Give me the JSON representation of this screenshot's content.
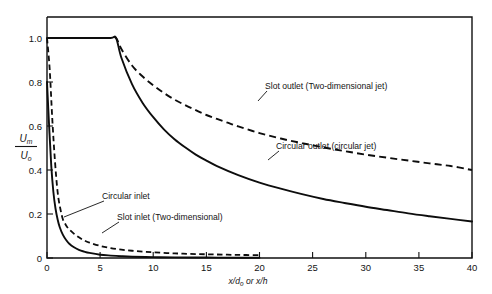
{
  "chart_data": {
    "type": "line",
    "title": "",
    "subtitle": "",
    "xlabel": "x/d₀ or x/h",
    "xlabel_parts": {
      "num": "x",
      "den": "d",
      "den_sub": "o",
      "conj": " or ",
      "second": "x/h"
    },
    "ylabel": "Um/Uo",
    "ylabel_parts": {
      "numerator": "U",
      "numerator_sub": "m",
      "denominator": "U",
      "denominator_sub": "o"
    },
    "xlim": [
      0,
      40
    ],
    "ylim": [
      0,
      1.0
    ],
    "xticks": [
      0,
      5,
      10,
      15,
      20,
      25,
      30,
      35,
      40
    ],
    "xticklabels": [
      "0",
      "5",
      "10",
      "15",
      "20",
      "25",
      "30",
      "35",
      "40"
    ],
    "yticks": [
      0,
      0.2,
      0.4,
      0.6,
      0.8,
      1.0
    ],
    "yticklabels": [
      "0",
      "0.2",
      "0.4",
      "0.6",
      "0.8",
      "1.0"
    ],
    "grid": false,
    "legend": "none",
    "series": [
      {
        "name": "Slot outlet (Two-dimensional jet)",
        "style": "dashed",
        "x": [
          0,
          2,
          4,
          6,
          6.5,
          7,
          8,
          9,
          10,
          11,
          12,
          13,
          14,
          15,
          16,
          17,
          18,
          20,
          22,
          24,
          26,
          28,
          30,
          32,
          34,
          36,
          38,
          40
        ],
        "y": [
          1.0,
          1.0,
          1.0,
          1.0,
          1.0,
          0.95,
          0.875,
          0.825,
          0.785,
          0.75,
          0.72,
          0.695,
          0.672,
          0.65,
          0.632,
          0.615,
          0.598,
          0.568,
          0.543,
          0.522,
          0.503,
          0.486,
          0.47,
          0.456,
          0.443,
          0.43,
          0.418,
          0.4
        ]
      },
      {
        "name": "Circular outlet (circular jet)",
        "style": "solid",
        "x": [
          0,
          2,
          4,
          6,
          6.5,
          7,
          8,
          9,
          10,
          11,
          12,
          13,
          14,
          15,
          16,
          18,
          20,
          22,
          24,
          26,
          28,
          30,
          32,
          34,
          36,
          38,
          40
        ],
        "y": [
          1.0,
          1.0,
          1.0,
          1.0,
          1.0,
          0.91,
          0.79,
          0.705,
          0.64,
          0.585,
          0.54,
          0.503,
          0.47,
          0.443,
          0.418,
          0.377,
          0.343,
          0.315,
          0.29,
          0.268,
          0.25,
          0.233,
          0.218,
          0.203,
          0.19,
          0.178,
          0.166
        ]
      },
      {
        "name": "Circular inlet",
        "style": "dashed-fine",
        "x": [
          0,
          0.25,
          0.5,
          0.75,
          1.0,
          1.25,
          1.5,
          1.75,
          2.0,
          2.5,
          3.0,
          3.5,
          4.0,
          5.0,
          6.0,
          7.0,
          8.0,
          9.0,
          10.0,
          12.0,
          14.0,
          16.0,
          18.0,
          20.0
        ],
        "y": [
          1.0,
          0.86,
          0.63,
          0.44,
          0.3,
          0.225,
          0.175,
          0.152,
          0.135,
          0.112,
          0.094,
          0.08,
          0.07,
          0.055,
          0.045,
          0.038,
          0.033,
          0.029,
          0.026,
          0.021,
          0.018,
          0.016,
          0.014,
          0.013
        ]
      },
      {
        "name": "Slot inlet (Two-dimensional)",
        "style": "solid",
        "x": [
          0,
          0.2,
          0.4,
          0.6,
          0.8,
          1.0,
          1.2,
          1.5,
          1.8,
          2.1,
          2.5,
          3.0,
          3.5,
          4.0,
          5.0,
          6.0,
          7.0,
          8.0,
          10.0,
          12.0,
          15.0,
          18.0,
          20.0
        ],
        "y": [
          0.8,
          0.6,
          0.42,
          0.3,
          0.225,
          0.175,
          0.14,
          0.105,
          0.082,
          0.065,
          0.05,
          0.037,
          0.029,
          0.023,
          0.015,
          0.011,
          0.008,
          0.006,
          0.004,
          0.003,
          0.002,
          0.001,
          0.001
        ]
      }
    ],
    "annotations": [
      {
        "text": "Slot outlet (Two-dimensional jet)",
        "x": 20.4,
        "y": 0.655
      },
      {
        "text": "Circular outlet (circular jet)",
        "x": 21.6,
        "y": 0.435
      },
      {
        "text": "Circular inlet",
        "x": 6.1,
        "y": 0.245
      },
      {
        "text": "Slot inlet (Two-dimensional)",
        "x": 8.3,
        "y": 0.155
      }
    ]
  },
  "colors": {
    "background": "#ffffff",
    "axis": "#111111",
    "curve": "#0d0d0d"
  }
}
